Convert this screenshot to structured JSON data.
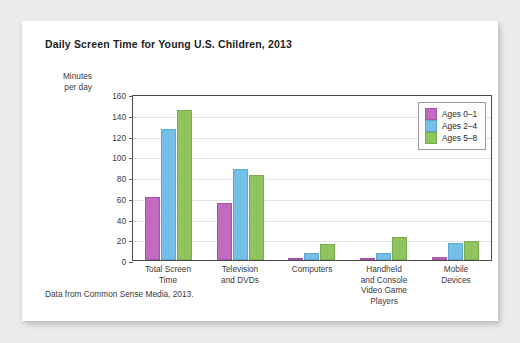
{
  "chart_data": {
    "type": "bar",
    "title": "Daily Screen Time for Young U.S. Children, 2013",
    "xlabel": "",
    "ylabel": "Minutes per day",
    "ylabel_lines": [
      "Minutes",
      "per day"
    ],
    "ylim": [
      0,
      160
    ],
    "ytick_step": 20,
    "yticks": [
      160,
      140,
      120,
      100,
      80,
      60,
      40,
      20,
      0
    ],
    "grid": true,
    "legend_position": "top-right-inside",
    "categories": [
      "Total Screen Time",
      "Television and DVDs",
      "Computers",
      "Handheld and Console Video Game Players",
      "Mobile Devices"
    ],
    "category_lines": [
      [
        "Total Screen",
        "Time"
      ],
      [
        "Television",
        "and DVDs"
      ],
      [
        "Computers"
      ],
      [
        "Handheld",
        "and Console",
        "Video Game",
        "Players"
      ],
      [
        "Mobile",
        "Devices"
      ]
    ],
    "series": [
      {
        "name": "Ages 0–1",
        "color": "#c06bc0",
        "values": [
          61,
          55,
          1,
          0,
          3
        ]
      },
      {
        "name": "Ages 2–4",
        "color": "#74c0e8",
        "values": [
          126,
          88,
          7,
          7,
          16
        ]
      },
      {
        "name": "Ages 5–8",
        "color": "#8fc45f",
        "values": [
          145,
          82,
          15,
          22,
          18
        ]
      }
    ],
    "caption": "Data from Common Sense Media, 2013."
  }
}
